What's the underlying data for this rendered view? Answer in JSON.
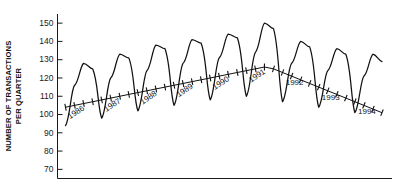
{
  "chart_data": {
    "type": "line",
    "title": "",
    "xlabel": "",
    "ylabel": "NUMBER OF TRANSACTIONS PER QUARTER",
    "ylabel_lines": [
      "NUMBER OF TRANSACTIONS",
      "PER QUARTER"
    ],
    "ylim": [
      65,
      155
    ],
    "yticks": [
      70,
      80,
      90,
      100,
      110,
      120,
      130,
      140,
      150
    ],
    "ytick_labels": [
      "70",
      "80",
      "90",
      "100",
      "110",
      "120",
      "130",
      "140",
      "150"
    ],
    "grid": false,
    "legend": null,
    "x_axis_visible": true,
    "x_tick_labels_visible": false,
    "categories": [
      "1986 Q1",
      "1986 Q2",
      "1986 Q3",
      "1986 Q4",
      "1987 Q1",
      "1987 Q2",
      "1987 Q3",
      "1987 Q4",
      "1988 Q1",
      "1988 Q2",
      "1988 Q3",
      "1988 Q4",
      "1989 Q1",
      "1989 Q2",
      "1989 Q3",
      "1989 Q4",
      "1990 Q1",
      "1990 Q2",
      "1990 Q3",
      "1990 Q4",
      "1991 Q1",
      "1991 Q2",
      "1991 Q3",
      "1991 Q4",
      "1992 Q1",
      "1992 Q2",
      "1992 Q3",
      "1992 Q4",
      "1993 Q1",
      "1993 Q2",
      "1993 Q3",
      "1993 Q4",
      "1994 Q1",
      "1994 Q2",
      "1994 Q3",
      "1994 Q4"
    ],
    "values": [
      94,
      116,
      128,
      125,
      98,
      120,
      133,
      131,
      102,
      124,
      138,
      136,
      105,
      128,
      141,
      139,
      108,
      131,
      144,
      142,
      110,
      134,
      150,
      147,
      107,
      128,
      140,
      137,
      104,
      124,
      136,
      133,
      101,
      121,
      133,
      129
    ],
    "series": [
      {
        "name": "Transactions per quarter",
        "values": [
          94,
          116,
          128,
          125,
          98,
          120,
          133,
          131,
          102,
          124,
          138,
          136,
          105,
          128,
          141,
          139,
          108,
          131,
          144,
          142,
          110,
          134,
          150,
          147,
          107,
          128,
          140,
          137,
          104,
          124,
          136,
          133,
          101,
          121,
          133,
          129
        ]
      }
    ],
    "trend": {
      "name": "Trend line with quarterly tick marks",
      "values": [
        104,
        105,
        106,
        107,
        108,
        109,
        110,
        111,
        112,
        113,
        114,
        115,
        116,
        117,
        118,
        119,
        120,
        121,
        122,
        123,
        124,
        125,
        126,
        125,
        123,
        121,
        119,
        117,
        115,
        113,
        111,
        109,
        107,
        105,
        103,
        101
      ],
      "ticks_per_year": 4
    },
    "year_labels": [
      "1986",
      "1987",
      "1988",
      "1989",
      "1990",
      "1991",
      "1992",
      "1993",
      "1994"
    ]
  }
}
